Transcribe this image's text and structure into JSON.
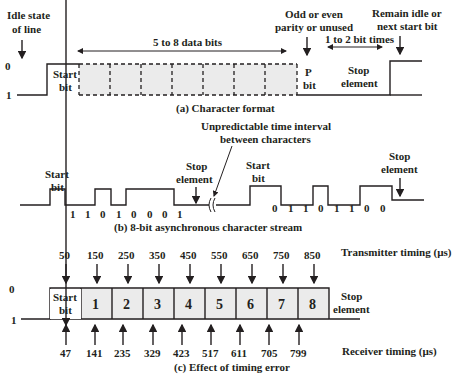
{
  "panel_a": {
    "caption": "(a) Character format",
    "idle_label_1": "Idle state",
    "idle_label_2": "of line",
    "level_0": "0",
    "level_1": "1",
    "start_bit_1": "Start",
    "start_bit_2": "bit",
    "data_bits": "5 to 8 data bits",
    "parity_1": "Odd or even",
    "parity_2": "parity or unused",
    "p_bit_1": "P",
    "p_bit_2": "bit",
    "stop_times": "1 to 2 bit times",
    "stop_1": "Stop",
    "stop_2": "element",
    "remain_1": "Remain idle or",
    "remain_2": "next start bit"
  },
  "panel_b": {
    "caption": "(b) 8-bit asynchronous character stream",
    "start_bit_1": "Start",
    "start_bit_2": "bit",
    "stop_1": "Stop",
    "stop_2": "element",
    "interval_1": "Unpredictable time interval",
    "interval_2": "between characters",
    "start_bit_b_1": "Start",
    "start_bit_b_2": "bit",
    "stop_b_1": "Stop",
    "stop_b_2": "element",
    "bits_char1": [
      "1",
      "1",
      "0",
      "1",
      "0",
      "0",
      "0",
      "1"
    ],
    "bits_char2": [
      "0",
      "1",
      "1",
      "0",
      "1",
      "1",
      "0",
      "0"
    ]
  },
  "panel_c": {
    "caption": "(c) Effect of timing error",
    "level_0": "0",
    "level_1": "1",
    "start_bit_1": "Start",
    "start_bit_2": "bit",
    "cells": [
      "1",
      "2",
      "3",
      "4",
      "5",
      "6",
      "7",
      "8"
    ],
    "stop_1": "Stop",
    "stop_2": "element",
    "transmitter_label": "Transmitter timing (µs)",
    "receiver_label": "Receiver timing (µs)",
    "transmitter_times": [
      "50",
      "150",
      "250",
      "350",
      "450",
      "550",
      "650",
      "750",
      "850"
    ],
    "receiver_times": [
      "47",
      "141",
      "235",
      "329",
      "423",
      "517",
      "611",
      "705",
      "799"
    ]
  }
}
